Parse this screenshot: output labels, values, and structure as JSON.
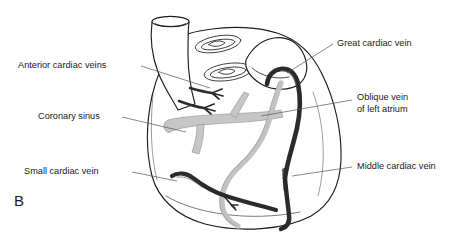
{
  "figure": {
    "panel_letter": "B",
    "background_color": "#ffffff"
  },
  "labels": [
    {
      "id": "anterior-cardiac-veins",
      "text": "Anterior cardiac veins",
      "side": "left",
      "text_x": 18,
      "text_y": 66,
      "leader": "M 141 66 L 210 88"
    },
    {
      "id": "coronary-sinus",
      "text": "Coronary sinus",
      "side": "left",
      "text_x": 38,
      "text_y": 117,
      "leader": "M 122 117 L 186 132"
    },
    {
      "id": "small-cardiac-vein",
      "text": "Small cardiac vein",
      "side": "left",
      "text_x": 24,
      "text_y": 172,
      "leader": "M 132 172 L 177 181"
    },
    {
      "id": "great-cardiac-vein",
      "text": "Great cardiac vein",
      "side": "right",
      "text_x": 337,
      "text_y": 44,
      "leader": "M 333 44 L 287 73"
    },
    {
      "id": "oblique-vein-of-left-atrium",
      "text": "Oblique vein",
      "text_line2": "of left atrium",
      "side": "right",
      "text_x": 357,
      "text_y": 98,
      "text_y2": 110,
      "leader": "M 352 100 L 261 116"
    },
    {
      "id": "middle-cardiac-vein",
      "text": "Middle cardiac vein",
      "side": "right",
      "text_x": 357,
      "text_y": 167,
      "leader": "M 352 167 L 292 176"
    }
  ],
  "colors": {
    "outline": "#1d1d1d",
    "vein_dark": "#2b2b2b",
    "vein_light": "#c6c6c6",
    "leader_line": "#555555",
    "text": "#1a1a1a"
  },
  "anatomy": {
    "structures": [
      {
        "name": "great-vessel-trunk",
        "kind": "outline"
      },
      {
        "name": "cut-vessel-ostium-upper",
        "kind": "ellipse"
      },
      {
        "name": "cut-vessel-ostium-lower",
        "kind": "ellipse"
      },
      {
        "name": "right-atrial-appendage",
        "kind": "outline"
      },
      {
        "name": "ventricular-mass",
        "kind": "outline"
      },
      {
        "name": "coronary-sinus-vessel",
        "kind": "vein-light"
      },
      {
        "name": "oblique-vein-vessel",
        "kind": "vein-light"
      },
      {
        "name": "great-cardiac-vein-vessel",
        "kind": "vein-dark"
      },
      {
        "name": "middle-cardiac-vein-vessel",
        "kind": "vein-dark"
      },
      {
        "name": "small-cardiac-vein-vessel",
        "kind": "vein-dark"
      },
      {
        "name": "anterior-cardiac-vein-branch-upper",
        "kind": "vein-dark"
      },
      {
        "name": "anterior-cardiac-vein-branch-lower",
        "kind": "vein-dark"
      }
    ]
  }
}
